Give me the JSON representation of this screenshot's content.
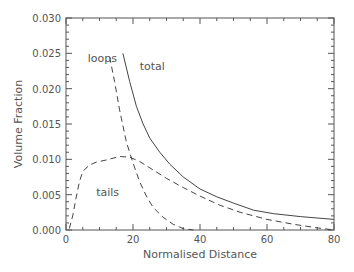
{
  "chart_data": {
    "type": "line",
    "title": "",
    "xlabel": "Normalised Distance",
    "ylabel": "Volume Fraction",
    "xlim": [
      0,
      80
    ],
    "ylim": [
      0,
      0.03
    ],
    "x_ticks": [
      "0",
      "20",
      "40",
      "60",
      "80"
    ],
    "y_ticks": [
      "0.000",
      "0.005",
      "0.010",
      "0.015",
      "0.020",
      "0.025",
      "0.030"
    ],
    "grid": false,
    "legend": "inline labels",
    "series": [
      {
        "name": "total",
        "style": "solid",
        "label_pos": [
          22,
          0.0227
        ],
        "points": [
          [
            17,
            0.025
          ],
          [
            19,
            0.021
          ],
          [
            21,
            0.0175
          ],
          [
            23,
            0.015
          ],
          [
            25,
            0.013
          ],
          [
            28,
            0.011
          ],
          [
            31,
            0.0093
          ],
          [
            35,
            0.0075
          ],
          [
            40,
            0.0058
          ],
          [
            45,
            0.0047
          ],
          [
            50,
            0.0038
          ],
          [
            56,
            0.0028
          ],
          [
            62,
            0.0023
          ],
          [
            70,
            0.0019
          ],
          [
            80,
            0.0015
          ]
        ]
      },
      {
        "name": "loops",
        "style": "dashed",
        "label_pos": [
          6.5,
          0.0238
        ],
        "points": [
          [
            13,
            0.0245
          ],
          [
            14.5,
            0.021
          ],
          [
            16,
            0.017
          ],
          [
            18,
            0.0125
          ],
          [
            20,
            0.0095
          ],
          [
            22,
            0.0068
          ],
          [
            24,
            0.0048
          ],
          [
            26,
            0.0032
          ],
          [
            29,
            0.0018
          ],
          [
            32,
            0.0008
          ],
          [
            35,
            0.0002
          ],
          [
            38,
            0.0
          ]
        ]
      },
      {
        "name": "tails",
        "style": "dashed",
        "label_pos": [
          9,
          0.0048
        ],
        "points": [
          [
            1,
            0.0002
          ],
          [
            2,
            0.002
          ],
          [
            3,
            0.0045
          ],
          [
            4,
            0.0068
          ],
          [
            5,
            0.0083
          ],
          [
            7,
            0.0092
          ],
          [
            9,
            0.0096
          ],
          [
            12,
            0.0099
          ],
          [
            16,
            0.0104
          ],
          [
            19,
            0.0103
          ],
          [
            22,
            0.0097
          ],
          [
            26,
            0.0085
          ],
          [
            30,
            0.0073
          ],
          [
            35,
            0.006
          ],
          [
            40,
            0.0048
          ],
          [
            46,
            0.0035
          ],
          [
            52,
            0.0025
          ],
          [
            60,
            0.0015
          ],
          [
            68,
            0.0008
          ],
          [
            75,
            0.0003
          ],
          [
            80,
            0.0
          ]
        ]
      }
    ]
  }
}
